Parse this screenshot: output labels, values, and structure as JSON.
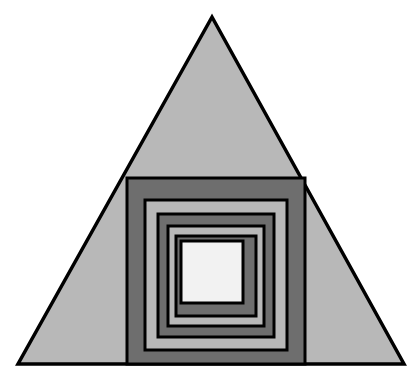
{
  "canvas": {
    "width": 419,
    "height": 384,
    "background_color": "#ffffff",
    "title": "Nested triangle with concentric squares"
  },
  "palette": {
    "outline": "#000000",
    "light_gray": "#b8b8b8",
    "dark_gray": "#6e6e6e",
    "white_center": "#f2f2f2",
    "background": "#ffffff"
  },
  "chart_data": {
    "type": "diagram",
    "shapes": [
      {
        "id": "triangle",
        "name": "outer-triangle",
        "type": "polygon",
        "points": [
          [
            212,
            17
          ],
          [
            404,
            364
          ],
          [
            18,
            364
          ]
        ],
        "fill": "#b8b8b8",
        "stroke": "#000000",
        "stroke_width": 3.5
      },
      {
        "id": "square-1",
        "name": "square-ring-1",
        "type": "rect",
        "x": 127,
        "y": 178,
        "width": 178,
        "height": 186,
        "fill": "#6e6e6e",
        "stroke": "#000000",
        "stroke_width": 3
      },
      {
        "id": "square-2",
        "name": "square-ring-2",
        "type": "rect",
        "x": 145,
        "y": 200,
        "width": 142,
        "height": 150,
        "fill": "#b8b8b8",
        "stroke": "#000000",
        "stroke_width": 3
      },
      {
        "id": "square-3",
        "name": "square-ring-3",
        "type": "rect",
        "x": 158,
        "y": 214,
        "width": 116,
        "height": 123,
        "fill": "#6e6e6e",
        "stroke": "#000000",
        "stroke_width": 3
      },
      {
        "id": "square-4",
        "name": "square-ring-4",
        "type": "rect",
        "x": 168,
        "y": 226,
        "width": 96,
        "height": 100,
        "fill": "#b8b8b8",
        "stroke": "#000000",
        "stroke_width": 3
      },
      {
        "id": "square-5",
        "name": "square-ring-5",
        "type": "rect",
        "x": 176,
        "y": 236,
        "width": 80,
        "height": 80,
        "fill": "#6e6e6e",
        "stroke": "#000000",
        "stroke_width": 3
      },
      {
        "id": "square-6",
        "name": "square-center-white",
        "type": "rect",
        "x": 181,
        "y": 241,
        "width": 62,
        "height": 62,
        "fill": "#f2f2f2",
        "stroke": "#000000",
        "stroke_width": 3
      }
    ],
    "counts": {
      "triangles": 1,
      "squares": 6,
      "total_shapes": 7
    }
  }
}
